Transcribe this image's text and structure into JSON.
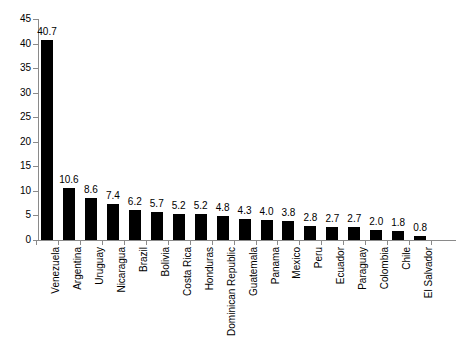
{
  "chart_data": {
    "type": "bar",
    "title": "",
    "subtitle": "",
    "xlabel": "",
    "ylabel": "",
    "ylim": [
      0,
      45
    ],
    "yticks": [
      0,
      5,
      10,
      15,
      20,
      25,
      30,
      35,
      40,
      45
    ],
    "ytick_labels": [
      "0",
      "5",
      "10",
      "15",
      "20",
      "25",
      "30",
      "35",
      "40",
      "45"
    ],
    "grid": false,
    "legend": false,
    "bar_color": "#000000",
    "axis_color": "#8a8a8a",
    "background_color": "#ffffff",
    "show_value_labels": true,
    "categories": [
      "Venezuela",
      "Argentina",
      "Uruguay",
      "Nicaragua",
      "Brazil",
      "Bolivia",
      "Costa Rica",
      "Honduras",
      "Dominican Republic",
      "Guatemala",
      "Panama",
      "Mexico",
      "Peru",
      "Ecuador",
      "Paraguay",
      "Colombia",
      "Chile",
      "El Salvador"
    ],
    "values": [
      40.7,
      10.6,
      8.6,
      7.4,
      6.2,
      5.7,
      5.2,
      5.2,
      4.8,
      4.3,
      4.0,
      3.8,
      2.8,
      2.7,
      2.7,
      2.0,
      1.8,
      0.8
    ],
    "value_labels": [
      "40.7",
      "10.6",
      "8.6",
      "7.4",
      "6.2",
      "5.7",
      "5.2",
      "5.2",
      "4.8",
      "4.3",
      "4.0",
      "3.8",
      "2.8",
      "2.7",
      "2.7",
      "2.0",
      "1.8",
      "0.8"
    ]
  }
}
